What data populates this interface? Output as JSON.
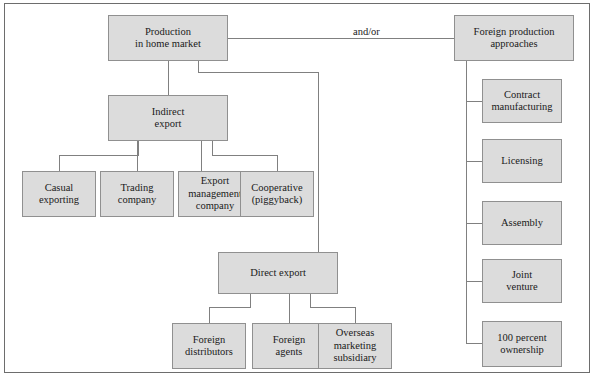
{
  "diagram": {
    "colors": {
      "box_fill": "#dcdcdc",
      "box_border": "#909090",
      "connector": "#808080",
      "frame_border": "#6d6d6d",
      "text": "#1a1a1a",
      "background": "#ffffff"
    },
    "annotations": [
      {
        "id": "and-or",
        "text": "and/or",
        "x": 350,
        "y": 26
      }
    ],
    "nodes": [
      {
        "id": "production-home-market",
        "label": "Production\nin home market",
        "x": 108,
        "y": 15,
        "w": 120,
        "h": 46
      },
      {
        "id": "foreign-production-approaches",
        "label": "Foreign production\napproaches",
        "x": 454,
        "y": 15,
        "w": 120,
        "h": 46
      },
      {
        "id": "indirect-export",
        "label": "Indirect\nexport",
        "x": 108,
        "y": 95,
        "w": 120,
        "h": 46
      },
      {
        "id": "casual-exporting",
        "label": "Casual\nexporting",
        "x": 22,
        "y": 171,
        "w": 74,
        "h": 46
      },
      {
        "id": "trading-company",
        "label": "Trading\ncompany",
        "x": 100,
        "y": 171,
        "w": 74,
        "h": 46
      },
      {
        "id": "export-management-company",
        "label": "Export\nmanagement\ncompany",
        "x": 178,
        "y": 171,
        "w": 74,
        "h": 46
      },
      {
        "id": "cooperative-piggyback",
        "label": "Cooperative\n(piggyback)",
        "x": 240,
        "y": 171,
        "w": 74,
        "h": 46
      },
      {
        "id": "direct-export",
        "label": "Direct export",
        "x": 218,
        "y": 252,
        "w": 120,
        "h": 42
      },
      {
        "id": "foreign-distributors",
        "label": "Foreign\ndistributors",
        "x": 172,
        "y": 323,
        "w": 74,
        "h": 46
      },
      {
        "id": "foreign-agents",
        "label": "Foreign\nagents",
        "x": 252,
        "y": 323,
        "w": 74,
        "h": 46
      },
      {
        "id": "overseas-marketing-subsidiary",
        "label": "Overseas\nmarketing\nsubsidiary",
        "x": 318,
        "y": 323,
        "w": 74,
        "h": 46
      },
      {
        "id": "contract-manufacturing",
        "label": "Contract\nmanufacturing",
        "x": 482,
        "y": 79,
        "w": 80,
        "h": 44
      },
      {
        "id": "licensing",
        "label": "Licensing",
        "x": 482,
        "y": 139,
        "w": 80,
        "h": 44
      },
      {
        "id": "assembly",
        "label": "Assembly",
        "x": 482,
        "y": 201,
        "w": 80,
        "h": 44
      },
      {
        "id": "joint-venture",
        "label": "Joint\nventure",
        "x": 482,
        "y": 259,
        "w": 80,
        "h": 44
      },
      {
        "id": "ownership-100-percent",
        "label": "100 percent\nownership",
        "x": 482,
        "y": 321,
        "w": 80,
        "h": 46
      }
    ],
    "connectors": [
      {
        "id": "production-to-foreign-approaches",
        "points": "228,38 454,38"
      },
      {
        "id": "production-to-indirect-export",
        "points": "168,61 168,95"
      },
      {
        "id": "production-to-direct-export",
        "points": "198,61 198,72 318,72 318,252"
      },
      {
        "id": "indirect-to-casual-exporting",
        "points": "138,141 138,155 59,155 59,171"
      },
      {
        "id": "indirect-to-trading-company",
        "points": "137,141 137,171"
      },
      {
        "id": "indirect-to-export-management",
        "points": "201,141 201,171"
      },
      {
        "id": "indirect-to-cooperative",
        "points": "212,141 212,155 277,155 277,171"
      },
      {
        "id": "direct-to-foreign-distributors",
        "points": "250,294 250,307 209,307 209,323"
      },
      {
        "id": "direct-to-foreign-agents",
        "points": "289,294 289,323"
      },
      {
        "id": "direct-to-overseas-subsidiary",
        "points": "310,294 310,307 355,307 355,323"
      },
      {
        "id": "foreign-approaches-spine",
        "points": "466,61 466,343"
      },
      {
        "id": "spine-to-contract-manufacturing",
        "points": "466,101 482,101"
      },
      {
        "id": "spine-to-licensing",
        "points": "466,161 482,161"
      },
      {
        "id": "spine-to-assembly",
        "points": "466,223 482,223"
      },
      {
        "id": "spine-to-joint-venture",
        "points": "466,281 466,281 482,281"
      },
      {
        "id": "spine-to-ownership",
        "points": "466,343 482,343"
      }
    ]
  }
}
